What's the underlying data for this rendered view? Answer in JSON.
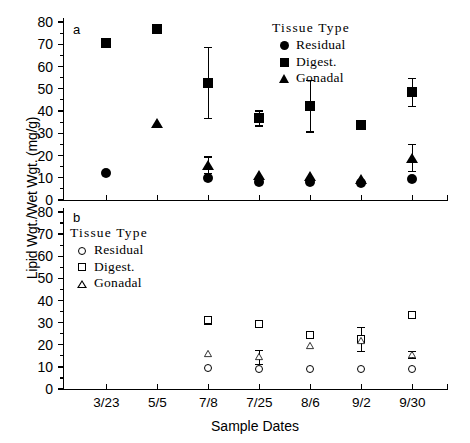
{
  "figure": {
    "ylabel": "Lipid Wgt./Wet Wgt. (mg/g)",
    "xlabel": "Sample Dates",
    "panel_a_letter": "a",
    "panel_b_letter": "b"
  },
  "legend": {
    "title": "Tissue Type",
    "entries_a": [
      {
        "label": "Residual",
        "marker": "filled-circle-icon"
      },
      {
        "label": "Digest.",
        "marker": "filled-square-icon"
      },
      {
        "label": "Gonadal",
        "marker": "filled-triangle-icon"
      }
    ],
    "entries_b": [
      {
        "label": "Residual",
        "marker": "open-circle-icon"
      },
      {
        "label": "Digest.",
        "marker": "open-square-icon"
      },
      {
        "label": "Gonadal",
        "marker": "open-triangle-icon"
      }
    ]
  },
  "chart_data": [
    {
      "type": "scatter",
      "panel": "a",
      "title": "a",
      "xlabel": "Sample Dates",
      "ylabel": "Lipid Wgt./Wet Wgt. (mg/g)",
      "categories": [
        "3/23",
        "5/5",
        "7/8",
        "7/25",
        "8/6",
        "9/2",
        "9/30"
      ],
      "yticks": [
        0,
        10,
        20,
        30,
        40,
        50,
        60,
        70,
        80
      ],
      "ylim": [
        0,
        80
      ],
      "grid": false,
      "legend_position": "top-right",
      "series": [
        {
          "name": "Residual",
          "marker": "filled-circle",
          "values": [
            12.3,
            null,
            9.8,
            8.3,
            8.0,
            7.6,
            9.4
          ],
          "errors": [
            null,
            null,
            null,
            null,
            null,
            null,
            null
          ]
        },
        {
          "name": "Digest.",
          "marker": "filled-square",
          "values": [
            70.6,
            76.8,
            52.8,
            36.9,
            42.4,
            33.5,
            48.6
          ],
          "errors": [
            null,
            null,
            16.0,
            3.4,
            11.6,
            null,
            6.3
          ]
        },
        {
          "name": "Gonadal",
          "marker": "filled-triangle",
          "values": [
            null,
            34.6,
            15.8,
            11.2,
            10.8,
            9.4,
            19.1
          ],
          "errors": [
            null,
            null,
            3.8,
            null,
            null,
            null,
            6.2
          ]
        }
      ]
    },
    {
      "type": "scatter",
      "panel": "b",
      "title": "b",
      "xlabel": "Sample Dates",
      "ylabel": "Lipid Wgt./Wet Wgt. (mg/g)",
      "categories": [
        "3/23",
        "5/5",
        "7/8",
        "7/25",
        "8/6",
        "9/2",
        "9/30"
      ],
      "yticks": [
        0,
        10,
        20,
        30,
        40,
        50,
        60,
        70,
        80
      ],
      "ylim": [
        0,
        80
      ],
      "grid": false,
      "legend_position": "top-left",
      "series": [
        {
          "name": "Residual",
          "marker": "open-circle",
          "values": [
            null,
            null,
            9.3,
            9.0,
            9.0,
            9.0,
            9.0
          ],
          "errors": [
            null,
            null,
            null,
            null,
            null,
            null,
            null
          ]
        },
        {
          "name": "Digest.",
          "marker": "open-square",
          "values": [
            null,
            null,
            31.0,
            29.4,
            24.6,
            22.6,
            33.6
          ],
          "errors": [
            null,
            null,
            1.6,
            null,
            null,
            5.4,
            null
          ]
        },
        {
          "name": "Gonadal",
          "marker": "open-triangle",
          "values": [
            null,
            null,
            16.2,
            14.5,
            19.6,
            22.0,
            15.6
          ],
          "errors": [
            null,
            null,
            null,
            3.2,
            null,
            null,
            1.6
          ]
        }
      ]
    }
  ]
}
